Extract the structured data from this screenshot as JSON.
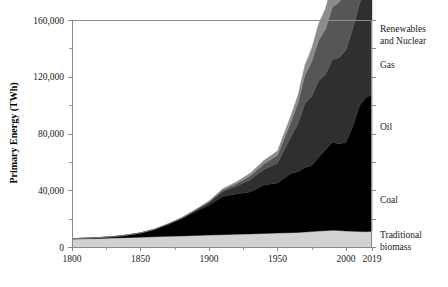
{
  "chart_data": {
    "type": "area",
    "title": "",
    "xlabel": "",
    "ylabel": "Primary Energy (TWh)",
    "xlim": [
      1800,
      2019
    ],
    "ylim": [
      0,
      160000
    ],
    "grid": false,
    "legend_position": "right-inline",
    "stacked": true,
    "x_ticks": [
      "1800",
      "1850",
      "1900",
      "1950",
      "2000",
      "2019"
    ],
    "x_tick_values": [
      1800,
      1850,
      1900,
      1950,
      2000,
      2019
    ],
    "x_minor_ticks": [
      1825,
      1875,
      1925,
      1975
    ],
    "y_ticks": [
      "0",
      "40,000",
      "80,000",
      "120,000",
      "160,000"
    ],
    "y_tick_values": [
      0,
      40000,
      80000,
      120000,
      160000
    ],
    "y_minor_ticks": [
      20000,
      60000,
      100000,
      140000
    ],
    "x": [
      1800,
      1810,
      1820,
      1830,
      1840,
      1850,
      1860,
      1870,
      1880,
      1890,
      1900,
      1910,
      1920,
      1930,
      1940,
      1950,
      1960,
      1965,
      1970,
      1975,
      1980,
      1985,
      1990,
      1995,
      2000,
      2005,
      2010,
      2015,
      2019
    ],
    "series": [
      {
        "name": "Traditional biomass",
        "color": "#d2d2d2",
        "values": [
          5600,
          5800,
          6000,
          6300,
          6600,
          6900,
          7200,
          7500,
          7800,
          8100,
          8400,
          8700,
          9000,
          9200,
          9500,
          9800,
          10100,
          10300,
          10600,
          10900,
          11200,
          11500,
          11800,
          11600,
          11300,
          11100,
          10900,
          10800,
          11100
        ]
      },
      {
        "name": "Coal",
        "color": "#000000",
        "values": [
          250,
          400,
          650,
          1000,
          1800,
          3000,
          5100,
          8400,
          12100,
          16700,
          21200,
          26900,
          28300,
          29600,
          34200,
          35300,
          41800,
          42800,
          45500,
          46400,
          52000,
          57000,
          62000,
          61000,
          62500,
          74000,
          89000,
          95000,
          96000
        ]
      },
      {
        "name": "Oil",
        "color": "#2f2f2f",
        "values": [
          0,
          0,
          0,
          0,
          0,
          0,
          60,
          200,
          500,
          1000,
          1800,
          3600,
          5600,
          8600,
          11000,
          14000,
          26000,
          34000,
          45000,
          49000,
          54000,
          53000,
          58000,
          61000,
          65000,
          69000,
          72000,
          76000,
          79000
        ]
      },
      {
        "name": "Gas",
        "color": "#565656",
        "values": [
          0,
          0,
          0,
          0,
          0,
          0,
          0,
          30,
          90,
          220,
          500,
          1000,
          1700,
          2600,
          3800,
          5500,
          10500,
          14500,
          20000,
          24500,
          28500,
          32000,
          37000,
          39000,
          42000,
          47000,
          53000,
          56000,
          60000
        ]
      },
      {
        "name": "Renewables and Nuclear",
        "color": "#8c8c8c",
        "values": [
          0,
          0,
          0,
          0,
          0,
          20,
          40,
          80,
          140,
          280,
          500,
          900,
          1300,
          1900,
          2400,
          3000,
          4700,
          5600,
          7000,
          9300,
          11500,
          14500,
          16500,
          18500,
          20500,
          22000,
          25500,
          29000,
          33000
        ]
      }
    ],
    "series_labels": [
      {
        "name": "Renewables and Nuclear",
        "line1": "Renewables",
        "line2": "and Nuclear"
      },
      {
        "name": "Gas",
        "line1": "Gas",
        "line2": ""
      },
      {
        "name": "Oil",
        "line1": "Oil",
        "line2": ""
      },
      {
        "name": "Coal",
        "line1": "Coal",
        "line2": ""
      },
      {
        "name": "Traditional biomass",
        "line1": "Traditional",
        "line2": "biomass"
      }
    ]
  }
}
